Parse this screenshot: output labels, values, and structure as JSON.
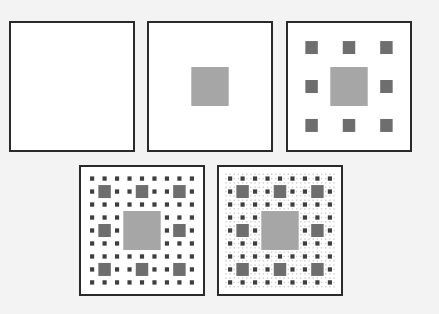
{
  "figure": {
    "colors": {
      "background": "#f3f3f3",
      "panel_fill": "#ffffff",
      "border": "#2a2a2a",
      "level1_hole": "#a6a6a6",
      "level2_hole": "#6e6e6e",
      "level3_hole": "#3e3e3e",
      "level4_hole": "#cfcfcf"
    },
    "panels": [
      {
        "iteration": 0,
        "x": 9,
        "y": 21
      },
      {
        "iteration": 1,
        "x": 147,
        "y": 21
      },
      {
        "iteration": 2,
        "x": 286,
        "y": 21
      },
      {
        "iteration": 3,
        "x": 79,
        "y": 165
      },
      {
        "iteration": 4,
        "x": 217,
        "y": 165
      }
    ]
  }
}
